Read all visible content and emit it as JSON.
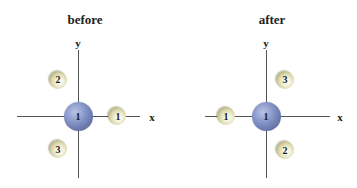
{
  "panels": [
    {
      "title": "before",
      "axes": {
        "x_label": "x",
        "y_label": "y"
      },
      "center_atom": {
        "label": "1",
        "color": "#8090c4"
      },
      "ligands": [
        {
          "label": "1",
          "position": "+x axis"
        },
        {
          "label": "2",
          "position": "upper-left"
        },
        {
          "label": "3",
          "position": "lower-left"
        }
      ]
    },
    {
      "title": "after",
      "axes": {
        "x_label": "x",
        "y_label": "y"
      },
      "center_atom": {
        "label": "1",
        "color": "#8090c4"
      },
      "ligands": [
        {
          "label": "1",
          "position": "-x axis"
        },
        {
          "label": "3",
          "position": "upper-right"
        },
        {
          "label": "2",
          "position": "lower-right"
        }
      ]
    }
  ],
  "colors": {
    "center_atom": "#8090c4",
    "ligand": "#d8d4a8",
    "axis": "#555555"
  }
}
